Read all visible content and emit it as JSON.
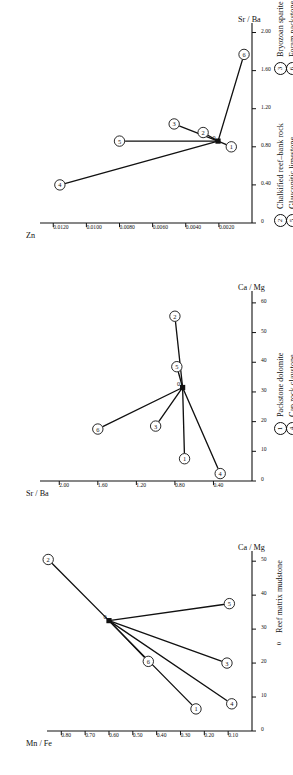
{
  "figure": {
    "orientation": "rotated-90-ccw",
    "panel_count": 3
  },
  "legend": {
    "title": "",
    "entries": [
      {
        "symbol": "0",
        "symbol_kind": "plain",
        "label": "Reef matrix mudstone"
      },
      {
        "symbol": "1",
        "symbol_kind": "circled",
        "label": "Packstone dolomite"
      },
      {
        "symbol": "4",
        "symbol_kind": "circled",
        "label": "Cap rock claystone"
      },
      {
        "symbol": "2",
        "symbol_kind": "circled",
        "label": "Chalkified reef–bank rock"
      },
      {
        "symbol": "5",
        "symbol_kind": "circled",
        "label": "Glauconitic limestone"
      },
      {
        "symbol": "3",
        "symbol_kind": "circled",
        "label": "Bryozoan sparite"
      },
      {
        "symbol": "6",
        "symbol_kind": "circled",
        "label": "Foram packstone"
      }
    ]
  },
  "chart_data": [
    {
      "id": "panel-left",
      "type": "scatter",
      "title": "",
      "xlabel": "Ca / Mg",
      "ylabel": "Mn / Fe",
      "xticks": [
        0,
        10,
        20,
        30,
        40,
        50
      ],
      "xticklabels": [
        "0",
        "10",
        "20",
        "30",
        "40",
        "50"
      ],
      "yticks": [
        0.1,
        0.2,
        0.3,
        0.4,
        0.5,
        0.6,
        0.7,
        0.8
      ],
      "yticklabels": [
        "0.10",
        "0.20",
        "0.30",
        "0.40",
        "0.50",
        "0.60",
        "0.70",
        "0.80"
      ],
      "xlim": [
        0,
        53
      ],
      "ylim": [
        0,
        0.86
      ],
      "grid": false,
      "origin_label": "0",
      "origin": {
        "x": 32.5,
        "y": 0.6
      },
      "points": [
        {
          "label": "1",
          "x": 6.5,
          "y": 0.235
        },
        {
          "label": "2",
          "x": 50.5,
          "y": 0.855
        },
        {
          "label": "3",
          "x": 20.0,
          "y": 0.105
        },
        {
          "label": "4",
          "x": 8.0,
          "y": 0.085
        },
        {
          "label": "5",
          "x": 37.5,
          "y": 0.095
        },
        {
          "label": "6",
          "x": 20.5,
          "y": 0.435
        }
      ]
    },
    {
      "id": "panel-middle",
      "type": "scatter",
      "title": "",
      "xlabel": "Ca / Mg",
      "ylabel": "Sr / Ba",
      "xticks": [
        0,
        10,
        20,
        30,
        40,
        50,
        60
      ],
      "xticklabels": [
        "0",
        "10",
        "20",
        "30",
        "40",
        "50",
        "60"
      ],
      "yticks": [
        0.4,
        0.8,
        1.2,
        1.6,
        2.0
      ],
      "yticklabels": [
        "0.40",
        "0.80",
        "1.20",
        "1.60",
        "2.00"
      ],
      "xlim": [
        0,
        64
      ],
      "ylim": [
        0,
        2.2
      ],
      "grid": false,
      "origin_label": "0",
      "origin": {
        "x": 31.5,
        "y": 0.72
      },
      "points": [
        {
          "label": "1",
          "x": 7.5,
          "y": 0.7
        },
        {
          "label": "2",
          "x": 55.5,
          "y": 0.8
        },
        {
          "label": "3",
          "x": 18.5,
          "y": 1.0
        },
        {
          "label": "4",
          "x": 2.5,
          "y": 0.33
        },
        {
          "label": "5",
          "x": 38.5,
          "y": 0.78
        },
        {
          "label": "6",
          "x": 17.5,
          "y": 1.6
        }
      ]
    },
    {
      "id": "panel-right",
      "type": "scatter",
      "title": "",
      "xlabel": "Sr / Ba",
      "ylabel": "Zn",
      "xticks": [
        0,
        0.4,
        0.8,
        1.2,
        1.6,
        2.0
      ],
      "xticklabels": [
        "0",
        "0.40",
        "0.80",
        "1.20",
        "1.60",
        "2.00"
      ],
      "yticks": [
        0.002,
        0.004,
        0.006,
        0.008,
        0.01,
        0.012
      ],
      "yticklabels": [
        "0.0020",
        "0.0040",
        "0.0060",
        "0.0080",
        "0.0100",
        "0.0120"
      ],
      "xlim": [
        0,
        2.1
      ],
      "ylim": [
        0,
        0.0128
      ],
      "grid": false,
      "origin_label": "0",
      "origin": {
        "x": 0.86,
        "y": 0.00205
      },
      "points": [
        {
          "label": "1",
          "x": 0.8,
          "y": 0.00125
        },
        {
          "label": "2",
          "x": 0.95,
          "y": 0.00295
        },
        {
          "label": "3",
          "x": 1.04,
          "y": 0.0047
        },
        {
          "label": "4",
          "x": 0.4,
          "y": 0.0116
        },
        {
          "label": "5",
          "x": 0.86,
          "y": 0.008
        },
        {
          "label": "6",
          "x": 1.77,
          "y": 0.00048
        }
      ]
    }
  ]
}
